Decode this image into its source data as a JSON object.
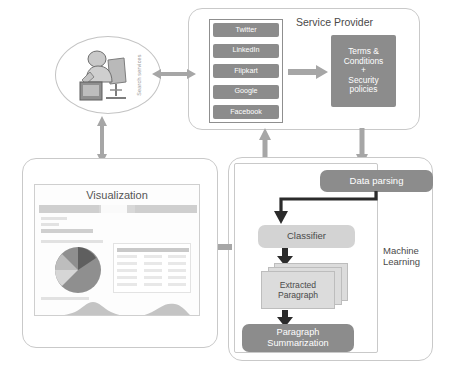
{
  "figure": {
    "type": "system-architecture-flow-diagram"
  },
  "user_node": {
    "label": "user-at-computer-icon",
    "side_text": "Search services"
  },
  "service_provider": {
    "title": "Service Provider",
    "sources": [
      {
        "label": "Twitter"
      },
      {
        "label": "LinkedIn"
      },
      {
        "label": "Flipkart"
      },
      {
        "label": "Google"
      },
      {
        "label": "Facebook"
      }
    ],
    "policy_box": "Terms &\nConditions\n+\nSecurity\npolicies"
  },
  "machine_learning": {
    "title": "Machine\nLearning",
    "steps": [
      {
        "id": "data-parsing",
        "label": "Data parsing",
        "style": "dark"
      },
      {
        "id": "classifier",
        "label": "Classifier",
        "style": "light"
      },
      {
        "id": "extracted-paragraph",
        "label": "Extracted\nParagraph",
        "style": "stack"
      },
      {
        "id": "paragraph-summarization",
        "label": "Paragraph\nSummarization",
        "style": "dark"
      }
    ]
  },
  "visualization": {
    "title": "Visualization",
    "dashboard": {
      "charts": [
        {
          "type": "pie",
          "name": "distribution-pie-chart"
        },
        {
          "type": "table",
          "name": "summary-data-table"
        },
        {
          "type": "area",
          "name": "density-area-chart-left"
        },
        {
          "type": "area",
          "name": "density-area-chart-right"
        }
      ]
    }
  },
  "connectors": [
    {
      "id": "user-to-provider",
      "direction": "bidirectional",
      "orientation": "horizontal"
    },
    {
      "id": "user-to-visualization",
      "direction": "bidirectional",
      "orientation": "vertical"
    },
    {
      "id": "sources-to-policies",
      "direction": "right",
      "orientation": "horizontal"
    },
    {
      "id": "provider-to-machine-learning",
      "direction": "down",
      "orientation": "vertical"
    },
    {
      "id": "visualization-to-user",
      "direction": "up",
      "orientation": "vertical"
    },
    {
      "id": "machine-learning-to-visualization",
      "direction": "left",
      "orientation": "horizontal"
    },
    {
      "id": "parsing-to-classifier",
      "direction": "down",
      "orientation": "vertical"
    },
    {
      "id": "classifier-to-extracted",
      "direction": "down",
      "orientation": "vertical"
    },
    {
      "id": "extracted-to-summarization",
      "direction": "down",
      "orientation": "vertical"
    }
  ],
  "colors": {
    "box_dark": "#8c8c8c",
    "box_light": "#d3d3d3",
    "arrow": "#a6a6a6",
    "border": "#c9c9c9",
    "text": "#4a4a4a"
  }
}
